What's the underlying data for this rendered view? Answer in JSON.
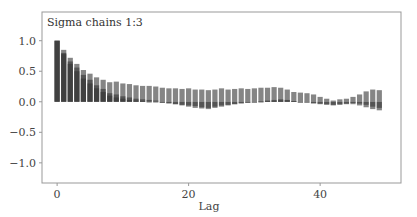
{
  "chart_data": {
    "type": "bar",
    "title": "Sigma chains 1:3",
    "xlabel": "Lag",
    "ylabel": "",
    "xlim": [
      -2.3,
      52.3
    ],
    "ylim": [
      -1.33,
      1.47
    ],
    "xticks": [
      0,
      20,
      40
    ],
    "yticks": [
      1.0,
      0.5,
      0.0,
      -0.5,
      -1.0
    ],
    "ytick_labels": [
      "1.0",
      "0.5",
      "0.0",
      "−0.5",
      "−1.0"
    ],
    "grid": false,
    "legend": null,
    "x": [
      0,
      1,
      2,
      3,
      4,
      5,
      6,
      7,
      8,
      9,
      10,
      11,
      12,
      13,
      14,
      15,
      16,
      17,
      18,
      19,
      20,
      21,
      22,
      23,
      24,
      25,
      26,
      27,
      28,
      29,
      30,
      31,
      32,
      33,
      34,
      35,
      36,
      37,
      38,
      39,
      40,
      41,
      42,
      43,
      44,
      45,
      46,
      47,
      48,
      49
    ],
    "series": [
      {
        "name": "chain 1",
        "values": [
          1.0,
          0.85,
          0.72,
          0.62,
          0.52,
          0.46,
          0.4,
          0.36,
          0.32,
          0.33,
          0.3,
          0.29,
          0.27,
          0.26,
          0.26,
          0.25,
          0.23,
          0.22,
          0.22,
          0.21,
          0.22,
          0.2,
          0.2,
          0.19,
          0.2,
          0.22,
          0.2,
          0.21,
          0.22,
          0.21,
          0.22,
          0.23,
          0.23,
          0.24,
          0.23,
          0.2,
          0.16,
          0.15,
          0.14,
          0.12,
          0.08,
          0.05,
          0.02,
          0.04,
          0.05,
          0.08,
          0.12,
          0.17,
          0.2,
          0.19
        ]
      },
      {
        "name": "chain 2",
        "values": [
          1.0,
          0.8,
          0.66,
          0.56,
          0.44,
          0.36,
          0.27,
          0.21,
          0.14,
          0.12,
          0.09,
          0.07,
          0.05,
          0.04,
          0.03,
          0.02,
          0.0,
          -0.02,
          -0.04,
          -0.06,
          -0.08,
          -0.1,
          -0.11,
          -0.12,
          -0.1,
          -0.08,
          -0.06,
          -0.04,
          -0.03,
          -0.02,
          0.0,
          0.01,
          0.02,
          0.03,
          0.04,
          0.03,
          0.01,
          0.0,
          -0.01,
          -0.03,
          -0.04,
          -0.05,
          -0.06,
          -0.05,
          -0.04,
          -0.04,
          -0.06,
          -0.09,
          -0.12,
          -0.14
        ]
      },
      {
        "name": "chain 3",
        "values": [
          1.0,
          0.78,
          0.62,
          0.5,
          0.38,
          0.3,
          0.22,
          0.16,
          0.1,
          0.07,
          0.05,
          0.03,
          0.02,
          0.01,
          0.0,
          -0.01,
          -0.02,
          -0.03,
          -0.04,
          -0.05,
          -0.06,
          -0.07,
          -0.09,
          -0.1,
          -0.08,
          -0.06,
          -0.05,
          -0.04,
          -0.02,
          -0.01,
          0.0,
          0.0,
          0.01,
          0.01,
          0.02,
          0.02,
          0.01,
          0.0,
          -0.01,
          -0.02,
          -0.03,
          -0.04,
          -0.05,
          -0.04,
          -0.03,
          -0.02,
          -0.03,
          -0.05,
          -0.08,
          -0.1
        ]
      }
    ],
    "bar_color": "#333333",
    "bar_alpha": 0.6
  },
  "plot": {
    "title": "Sigma chains 1:3",
    "xlabel": "Lag",
    "xtick_labels": [
      "0",
      "20",
      "40"
    ],
    "ytick_labels": [
      "1.0",
      "0.5",
      "0.0",
      "−0.5",
      "−1.0"
    ]
  }
}
